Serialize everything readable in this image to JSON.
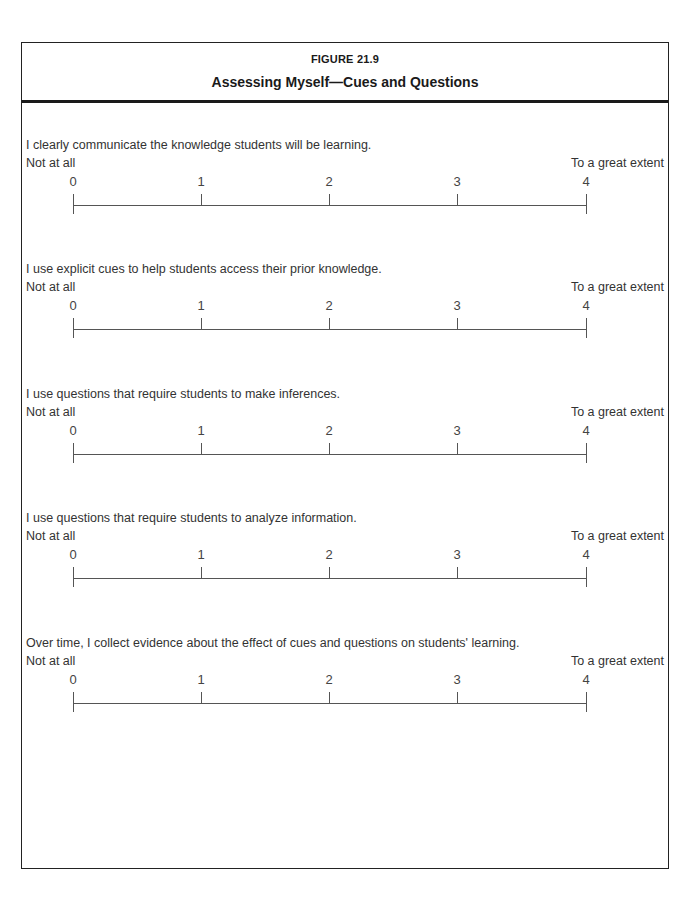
{
  "figure": {
    "label": "FIGURE 21.9",
    "title": "Assessing Myself—Cues and Questions"
  },
  "scale": {
    "low_anchor": "Not at all",
    "high_anchor": "To a great extent",
    "points": [
      "0",
      "1",
      "2",
      "3",
      "4"
    ]
  },
  "items": [
    {
      "statement": "I clearly communicate the knowledge students will be learning."
    },
    {
      "statement": "I use explicit cues to help students access their prior knowledge."
    },
    {
      "statement": "I use questions that require students to make inferences."
    },
    {
      "statement": "I use questions that require students to analyze information."
    },
    {
      "statement": "Over time, I collect evidence about the effect of cues and questions on students' learning."
    }
  ]
}
